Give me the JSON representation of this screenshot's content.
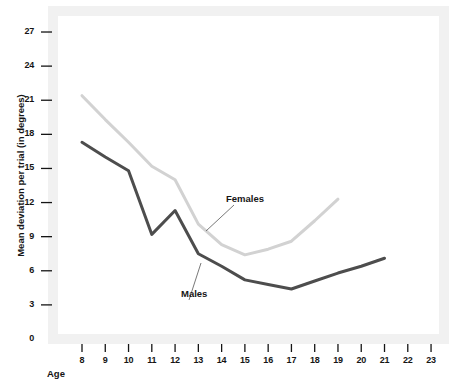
{
  "chart_data": {
    "type": "line",
    "title": "",
    "subtitle": "",
    "xlabel": "Age",
    "ylabel": "Mean deviation per trial (in degrees)",
    "x": [
      8,
      9,
      10,
      11,
      12,
      13,
      14,
      15,
      16,
      17,
      18,
      19,
      20,
      21,
      22,
      23
    ],
    "xlim": [
      8,
      23
    ],
    "ylim": [
      0,
      27
    ],
    "yticks": [
      0,
      3,
      6,
      9,
      12,
      15,
      18,
      21,
      24,
      27
    ],
    "xticks": [
      8,
      9,
      10,
      11,
      12,
      13,
      14,
      15,
      16,
      17,
      18,
      19,
      20,
      21,
      22,
      23
    ],
    "grid": false,
    "legend_position": "inline-annotation",
    "series": [
      {
        "name": "Females",
        "color": "#d2d2d2",
        "x": [
          8,
          9,
          10,
          11,
          12,
          13,
          14,
          15,
          16,
          17,
          18,
          19
        ],
        "values": [
          21.4,
          19.3,
          17.3,
          15.2,
          14.0,
          10.1,
          8.3,
          7.4,
          7.9,
          8.6,
          10.4,
          12.3
        ]
      },
      {
        "name": "Males",
        "color": "#4d4d4d",
        "x": [
          8,
          9,
          10,
          11,
          12,
          13,
          14,
          15,
          16,
          17,
          18,
          19,
          20,
          21
        ],
        "values": [
          17.3,
          16.0,
          14.8,
          9.2,
          11.3,
          7.5,
          6.4,
          5.2,
          4.8,
          4.4,
          5.1,
          5.8,
          6.4,
          7.1
        ]
      }
    ],
    "annotations": [
      {
        "text": "Females",
        "x_px": 226,
        "y_px": 200
      },
      {
        "text": "Males",
        "x_px": 181,
        "y_px": 295
      }
    ],
    "colors": {
      "females_line": "#d2d2d2",
      "males_line": "#4d4d4d",
      "frame": "#f1f1f1",
      "plot_background": "#ffffff",
      "text": "#151515"
    }
  }
}
